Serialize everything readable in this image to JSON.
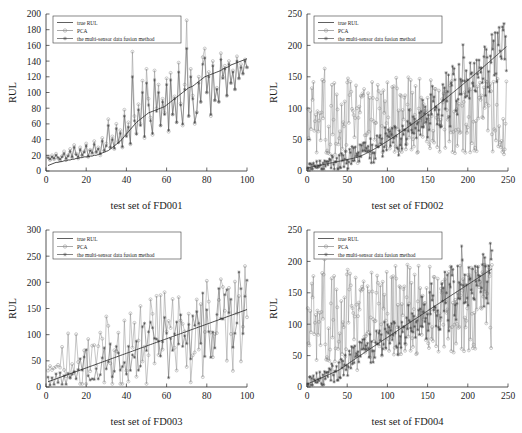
{
  "figure": {
    "name": "rul-prediction-comparison-figure",
    "background": "#ffffff",
    "ink": "#1d1d1d"
  },
  "legend_common": {
    "items": [
      {
        "key": "true",
        "label": "true RUL",
        "style": "solid-line",
        "marker": "none",
        "color": "#2b2b2b"
      },
      {
        "key": "pca",
        "label": "PCA",
        "style": "line-marker",
        "marker": "circle",
        "color": "#8d8d8d"
      },
      {
        "key": "fusion",
        "label": "the multi-sensor data fusion method",
        "style": "line-marker",
        "marker": "asterisk",
        "color": "#5a5a5a"
      }
    ]
  },
  "chart_data": [
    {
      "id": "fd001",
      "type": "line",
      "title": "",
      "xlabel": "test set of  FD001",
      "ylabel": "RUL",
      "xlim": [
        0,
        100
      ],
      "ylim": [
        0,
        200
      ],
      "xticks": [
        0,
        20,
        40,
        60,
        80,
        100
      ],
      "yticks": [
        0,
        20,
        40,
        60,
        80,
        100,
        120,
        140,
        160,
        180,
        200
      ],
      "grid": false,
      "legend_position": "top-left",
      "x": [
        1,
        2,
        3,
        4,
        5,
        6,
        7,
        8,
        9,
        10,
        11,
        12,
        13,
        14,
        15,
        16,
        17,
        18,
        19,
        20,
        21,
        22,
        23,
        24,
        25,
        26,
        27,
        28,
        29,
        30,
        31,
        32,
        33,
        34,
        35,
        36,
        37,
        38,
        39,
        40,
        41,
        42,
        43,
        44,
        45,
        46,
        47,
        48,
        49,
        50,
        51,
        52,
        53,
        54,
        55,
        56,
        57,
        58,
        59,
        60,
        61,
        62,
        63,
        64,
        65,
        66,
        67,
        68,
        69,
        70,
        71,
        72,
        73,
        74,
        75,
        76,
        77,
        78,
        79,
        80,
        81,
        82,
        83,
        84,
        85,
        86,
        87,
        88,
        89,
        90,
        91,
        92,
        93,
        94,
        95,
        96,
        97,
        98,
        99,
        100
      ],
      "series": [
        {
          "name": "true RUL",
          "key": "true",
          "values": [
            7,
            8,
            9,
            10,
            11,
            11,
            12,
            12,
            13,
            13,
            14,
            14,
            15,
            15,
            16,
            16,
            17,
            17,
            18,
            18,
            18,
            19,
            19,
            20,
            20,
            21,
            22,
            23,
            24,
            25,
            26,
            28,
            30,
            32,
            34,
            36,
            38,
            41,
            44,
            47,
            50,
            53,
            56,
            59,
            62,
            64,
            66,
            68,
            70,
            72,
            74,
            75,
            76,
            77,
            78,
            79,
            80,
            81,
            82,
            84,
            86,
            88,
            90,
            92,
            94,
            96,
            98,
            100,
            102,
            104,
            106,
            107,
            108,
            110,
            112,
            114,
            116,
            118,
            120,
            121,
            122,
            123,
            124,
            125,
            126,
            127,
            128,
            130,
            131,
            132,
            133,
            135,
            136,
            137,
            138,
            139,
            140,
            141,
            142,
            143
          ]
        },
        {
          "name": "PCA",
          "key": "pca",
          "values": [
            18,
            14,
            20,
            15,
            22,
            16,
            13,
            19,
            25,
            14,
            20,
            28,
            17,
            33,
            22,
            16,
            30,
            20,
            25,
            35,
            18,
            27,
            22,
            38,
            24,
            30,
            20,
            42,
            26,
            35,
            66,
            30,
            44,
            28,
            60,
            38,
            52,
            30,
            78,
            46,
            62,
            34,
            152,
            70,
            48,
            85,
            60,
            115,
            42,
            130,
            92,
            68,
            46,
            128,
            80,
            110,
            58,
            92,
            74,
            118,
            50,
            125,
            72,
            95,
            62,
            138,
            86,
            58,
            110,
            192,
            70,
            130,
            96,
            60,
            75,
            120,
            88,
            145,
            156,
            100,
            126,
            70,
            140,
            90,
            106,
            88,
            150,
            120,
            134,
            96,
            140,
            112,
            128,
            104,
            146,
            118,
            136,
            124,
            142,
            132
          ]
        },
        {
          "name": "the multi-sensor data fusion method",
          "key": "fusion",
          "values": [
            17,
            15,
            18,
            16,
            20,
            17,
            15,
            18,
            22,
            16,
            19,
            25,
            18,
            30,
            21,
            18,
            27,
            20,
            24,
            32,
            19,
            26,
            23,
            34,
            24,
            28,
            22,
            38,
            26,
            32,
            58,
            30,
            40,
            29,
            54,
            36,
            48,
            31,
            70,
            44,
            56,
            35,
            120,
            64,
            47,
            78,
            58,
            100,
            44,
            112,
            84,
            64,
            48,
            116,
            76,
            100,
            58,
            88,
            72,
            110,
            52,
            116,
            72,
            92,
            62,
            126,
            84,
            60,
            104,
            156,
            70,
            120,
            92,
            62,
            74,
            112,
            88,
            136,
            144,
            100,
            120,
            72,
            134,
            90,
            104,
            88,
            142,
            118,
            130,
            96,
            136,
            112,
            126,
            104,
            140,
            118,
            132,
            124,
            140,
            132
          ]
        }
      ]
    },
    {
      "id": "fd002",
      "type": "line",
      "title": "",
      "xlabel": "test set of  FD002",
      "ylabel": "RUL",
      "xlim": [
        0,
        250
      ],
      "ylim": [
        0,
        250
      ],
      "xticks": [
        0,
        50,
        100,
        150,
        200,
        250
      ],
      "yticks": [
        0,
        50,
        100,
        150,
        200,
        250
      ],
      "grid": false,
      "legend_position": "top-left",
      "n": 248,
      "series": [
        {
          "name": "true RUL",
          "key": "true",
          "model": "true-fd002"
        },
        {
          "name": "PCA",
          "key": "pca",
          "model": "pca-fd002"
        },
        {
          "name": "the multi-sensor data fusion method",
          "key": "fusion",
          "model": "fusion-fd002"
        }
      ],
      "notes": "true RUL rises slowly from ~5 to ~20 over x=0..60 then climbs nearly linearly to ~198 at x=248; PCA scatters 25..160 with no trend; fusion tracks true RUL with noise growing with x"
    },
    {
      "id": "fd003",
      "type": "line",
      "title": "",
      "xlabel": "test set of  FD003",
      "ylabel": "RUL",
      "xlim": [
        0,
        100
      ],
      "ylim": [
        0,
        300
      ],
      "xticks": [
        0,
        20,
        40,
        60,
        80,
        100
      ],
      "yticks": [
        0,
        50,
        100,
        150,
        200,
        250,
        300
      ],
      "grid": false,
      "legend_position": "top-left",
      "n": 100,
      "series": [
        {
          "name": "true RUL",
          "key": "true",
          "model": "true-fd003"
        },
        {
          "name": "PCA",
          "key": "pca",
          "model": "pca-fd003"
        },
        {
          "name": "the multi-sensor data fusion method",
          "key": "fusion",
          "model": "fusion-fd003"
        }
      ],
      "notes": "true RUL rises from ~10 to ~148 across x=0..100; PCA noisy 20..250; fusion noisy around true with peaks to ~255"
    },
    {
      "id": "fd004",
      "type": "line",
      "title": "",
      "xlabel": "test set of  FD004",
      "ylabel": "RUL",
      "xlim": [
        0,
        250
      ],
      "ylim": [
        0,
        250
      ],
      "xticks": [
        0,
        50,
        100,
        150,
        200,
        250
      ],
      "yticks": [
        0,
        50,
        100,
        150,
        200,
        250
      ],
      "grid": false,
      "legend_position": "top-left",
      "n": 232,
      "series": [
        {
          "name": "true RUL",
          "key": "true",
          "model": "true-fd004"
        },
        {
          "name": "PCA",
          "key": "pca",
          "model": "pca-fd004"
        },
        {
          "name": "the multi-sensor data fusion method",
          "key": "fusion",
          "model": "fusion-fd004"
        }
      ],
      "notes": "true RUL rises from ~5 to ~188 at x=230; PCA scatters 30..210 widely; fusion follows true with heavy noise"
    }
  ]
}
